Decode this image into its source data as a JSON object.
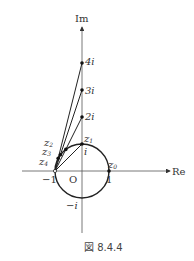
{
  "figure": {
    "caption": "図 8.4.4",
    "axes": {
      "real_label": "Re",
      "imag_label": "Im",
      "origin_label": "O"
    },
    "unit_circle": {
      "center": [
        0,
        0
      ],
      "radius": 1
    },
    "tick_labels": {
      "neg_one": "−1",
      "one": "1",
      "i": "i",
      "neg_i": "−i",
      "two_i": "2i",
      "three_i": "3i",
      "four_i": "4i"
    },
    "imag_points": [
      {
        "label": "2i",
        "value": [
          0,
          2
        ]
      },
      {
        "label": "3i",
        "value": [
          0,
          3
        ]
      },
      {
        "label": "4i",
        "value": [
          0,
          4
        ]
      }
    ],
    "circle_points": [
      {
        "name": "z0",
        "sub": "0",
        "value": [
          1,
          0
        ]
      },
      {
        "name": "z1",
        "sub": "1",
        "value": [
          0,
          1
        ]
      },
      {
        "name": "z2",
        "sub": "2",
        "value": [
          -0.6,
          0.8
        ]
      },
      {
        "name": "z3",
        "sub": "3",
        "value": [
          -0.8,
          0.6
        ]
      },
      {
        "name": "z4",
        "sub": "4",
        "value": [
          -0.882,
          0.471
        ]
      }
    ],
    "lines_from_minus_one_to": [
      [
        0,
        1
      ],
      [
        0,
        2
      ],
      [
        0,
        3
      ],
      [
        0,
        4
      ]
    ],
    "point_labels": {
      "z_letter": "z"
    }
  }
}
